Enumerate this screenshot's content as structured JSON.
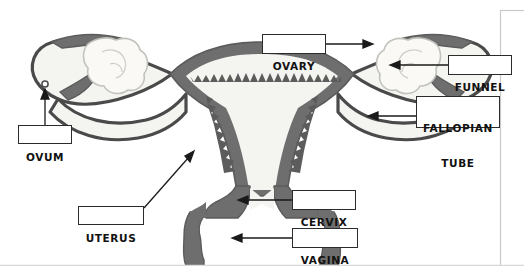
{
  "figure": {
    "background_color": "#ffffff",
    "border_color": "#c9c9c9",
    "wall_color": "#6e6e6e",
    "wall_dark_color": "#5c5c5c",
    "lumen_color": "#f4f4f1",
    "outline_color": "#4a4a4a",
    "ovary_outline_color": "#c2c2bd",
    "ovary_fill_color": "#faf9f6",
    "label_text_color": "#111111",
    "label_border_color": "#2b2b2b",
    "leader_line_color": "#1a1a1a"
  },
  "labels": [
    {
      "id": "ovum",
      "text": "OVUM",
      "lines": [
        "OVUM"
      ],
      "box": {
        "left": 18,
        "top": 125,
        "width": 54,
        "height": 19
      },
      "leader": {
        "x1": 45,
        "y1": 125,
        "x2": 45,
        "y2": 96
      },
      "arrow": {
        "x": 45,
        "y": 92,
        "direction": "up"
      }
    },
    {
      "id": "uterus",
      "text": "UTERUS",
      "lines": [
        "UTERUS"
      ],
      "box": {
        "left": 78,
        "top": 206,
        "width": 66,
        "height": 19
      },
      "leader": {
        "x1": 144,
        "y1": 208,
        "x2": 190,
        "y2": 156
      },
      "arrow": {
        "x": 193,
        "y": 153,
        "direction": "up-right"
      }
    },
    {
      "id": "ovary",
      "text": "OVARY",
      "lines": [
        "OVARY"
      ],
      "box": {
        "left": 262,
        "top": 34,
        "width": 64,
        "height": 20
      },
      "leader": {
        "x1": 326,
        "y1": 44,
        "x2": 366,
        "y2": 44
      },
      "arrow": {
        "x": 370,
        "y": 44,
        "direction": "right"
      }
    },
    {
      "id": "funnel",
      "text": "FUNNEL",
      "lines": [
        "FUNNEL"
      ],
      "box": {
        "left": 448,
        "top": 55,
        "width": 64,
        "height": 20
      },
      "leader": {
        "x1": 448,
        "y1": 65,
        "x2": 396,
        "y2": 65
      },
      "arrow": {
        "x": 392,
        "y": 65,
        "direction": "left"
      }
    },
    {
      "id": "fallopian-tube",
      "text": "FALLOPIAN TUBE",
      "lines": [
        "FALLOPIAN",
        "TUBE"
      ],
      "box": {
        "left": 416,
        "top": 96,
        "width": 84,
        "height": 32
      },
      "leader": {
        "x1": 416,
        "y1": 116,
        "x2": 374,
        "y2": 116
      },
      "arrow": {
        "x": 370,
        "y": 116,
        "direction": "left"
      }
    },
    {
      "id": "cervix",
      "text": "CERVIX",
      "lines": [
        "CERVIX"
      ],
      "box": {
        "left": 292,
        "top": 190,
        "width": 64,
        "height": 20
      },
      "leader": {
        "x1": 292,
        "y1": 200,
        "x2": 244,
        "y2": 200
      },
      "arrow": {
        "x": 240,
        "y": 200,
        "direction": "left"
      }
    },
    {
      "id": "vagina",
      "text": "VAGINA",
      "lines": [
        "VAGINA"
      ],
      "box": {
        "left": 292,
        "top": 228,
        "width": 66,
        "height": 20
      },
      "leader": {
        "x1": 292,
        "y1": 238,
        "x2": 238,
        "y2": 238
      },
      "arrow": {
        "x": 234,
        "y": 238,
        "direction": "left"
      }
    }
  ],
  "structures": [
    {
      "id": "uterus-body",
      "name": "uterus"
    },
    {
      "id": "endometrium",
      "name": "endometrial-lining"
    },
    {
      "id": "left-tube",
      "name": "left-fallopian-tube"
    },
    {
      "id": "right-tube",
      "name": "right-fallopian-tube"
    },
    {
      "id": "left-ovary",
      "name": "left-ovary"
    },
    {
      "id": "right-ovary",
      "name": "right-ovary"
    },
    {
      "id": "left-funnel",
      "name": "left-funnel-fimbriae"
    },
    {
      "id": "right-funnel",
      "name": "right-funnel-fimbriae"
    },
    {
      "id": "ovum-dot",
      "name": "ovum"
    },
    {
      "id": "cervix-body",
      "name": "cervix"
    },
    {
      "id": "vaginal-canal",
      "name": "vagina"
    }
  ]
}
